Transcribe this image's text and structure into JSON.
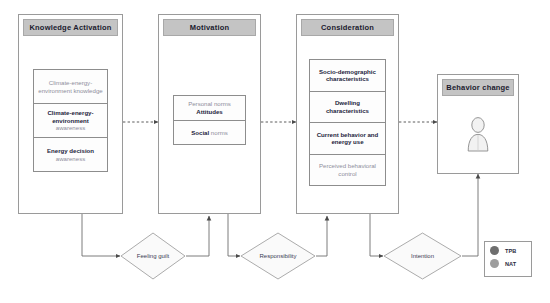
{
  "diagram": {
    "columns": [
      {
        "id": "knowledge-activation",
        "header": "Knowledge Activation",
        "cells": [
          {
            "bold": "",
            "light": "Climate-energy-environment knowledge",
            "style": "light"
          },
          {
            "bold": "Climate-energy-environment",
            "light": "awareness",
            "style": "bold-light"
          },
          {
            "bold": "Energy decision",
            "light": "awareness",
            "style": "bold-light"
          }
        ]
      },
      {
        "id": "motivation",
        "header": "Motivation",
        "cells": [
          {
            "bold": "Attitudes",
            "light": "Personal norms",
            "style": "light-over-bold"
          },
          {
            "bold": "Social",
            "light": "norms",
            "style": "inline-mix"
          }
        ]
      },
      {
        "id": "consideration",
        "header": "Consideration",
        "cells": [
          {
            "bold": "Socio-demographic characteristics",
            "light": "",
            "style": "bold"
          },
          {
            "bold": "Dwelling characteristics",
            "light": "",
            "style": "bold"
          },
          {
            "bold": "Current behavior and energy use",
            "light": "",
            "style": "bold"
          },
          {
            "bold": "",
            "light": "Perceived behavioral control",
            "style": "light"
          }
        ]
      }
    ],
    "outcome": {
      "id": "behavior-change",
      "header": "Behavior change",
      "icon": "person-icon"
    },
    "diamonds": [
      {
        "id": "feeling-guilt",
        "label": "Feeling guilt"
      },
      {
        "id": "responsibility",
        "label": "Responsibility"
      },
      {
        "id": "intention",
        "label": "Intention"
      }
    ],
    "legend": {
      "items": [
        {
          "label": "TPB",
          "color": "#6e6e6e"
        },
        {
          "label": "NAT",
          "color": "#9d9d9d"
        }
      ]
    },
    "colors": {
      "header_fill": "#c4c4c4",
      "box_border": "#9a9a9a",
      "inner_border": "#8d8d8d",
      "text_bold": "#24243c",
      "text_light": "#8e8e9c",
      "wire": "#7a7a7a"
    }
  }
}
